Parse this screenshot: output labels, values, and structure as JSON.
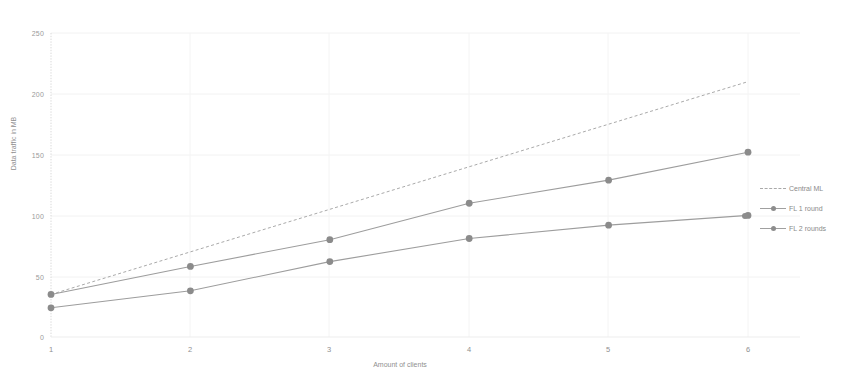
{
  "chart_data": {
    "type": "line",
    "title": "",
    "xlabel": "Amount of clients",
    "ylabel": "Data traffic in MB",
    "x": [
      1,
      2,
      3,
      4,
      5,
      6
    ],
    "xtick_labels": [
      "1",
      "2",
      "3",
      "4",
      "5",
      "6"
    ],
    "ytick_labels": [
      "0",
      "50",
      "100",
      "150",
      "200",
      "250"
    ],
    "yticks": [
      0,
      50,
      100,
      150,
      200,
      250
    ],
    "xlim": [
      1,
      6
    ],
    "ylim": [
      0,
      250
    ],
    "grid": "faint vertical and horizontal gridlines",
    "legend_position": "right",
    "series": [
      {
        "name": "Central ML",
        "style": "dashed",
        "markers": false,
        "color": "#a9a9a9",
        "values": [
          35,
          70,
          105,
          140,
          175,
          210
        ]
      },
      {
        "name": "FL 1 round",
        "style": "solid",
        "markers": true,
        "color": "#9a9a9a",
        "values": [
          24,
          38,
          62,
          81,
          92,
          100
        ]
      },
      {
        "name": "FL 2 rounds",
        "style": "solid",
        "markers": true,
        "color": "#9a9a9a",
        "values": [
          35,
          58,
          80,
          110,
          129,
          152
        ]
      }
    ]
  },
  "legend": {
    "items": [
      {
        "label": "Central ML"
      },
      {
        "label": "FL 1 round"
      },
      {
        "label": "FL 2 rounds"
      }
    ]
  },
  "axes": {
    "y_title": "Data traffic in MB",
    "x_title": "Amount of clients",
    "y_labels": [
      "250",
      "200",
      "150",
      "100",
      "50",
      "0"
    ],
    "x_labels": [
      "1",
      "2",
      "3",
      "4",
      "5",
      "6"
    ]
  },
  "colors": {
    "line_gray": "#9a9a9a",
    "dashed_gray": "#a9a9a9",
    "marker_gray": "#8d8d8d",
    "text_gray": "#8f8f8f",
    "axis_gray": "#d8d8d8",
    "grid_gray": "#f0f0f0",
    "background": "#ffffff"
  }
}
